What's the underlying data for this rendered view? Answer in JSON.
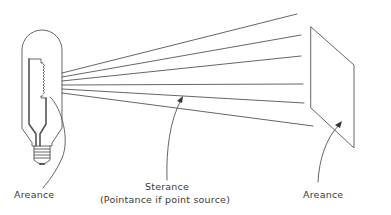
{
  "diagram": {
    "labels": {
      "source_areance": "Areance",
      "sterance": "Sterance",
      "pointance_note": "(Pointance if point source)",
      "target_areance": "Areance"
    },
    "colors": {
      "stroke": "#555555",
      "text": "#3a3a3a",
      "background": "#ffffff"
    },
    "nodes": [
      {
        "id": "lamp",
        "type": "light-bulb-source"
      },
      {
        "id": "rays",
        "type": "ray-bundle",
        "count": 6
      },
      {
        "id": "surface",
        "type": "receiving-surface"
      }
    ],
    "annotations": [
      {
        "label": "Areance",
        "points_to": "lamp filament"
      },
      {
        "label": "Sterance",
        "points_to": "rays"
      },
      {
        "label": "Areance",
        "points_to": "surface"
      }
    ]
  }
}
